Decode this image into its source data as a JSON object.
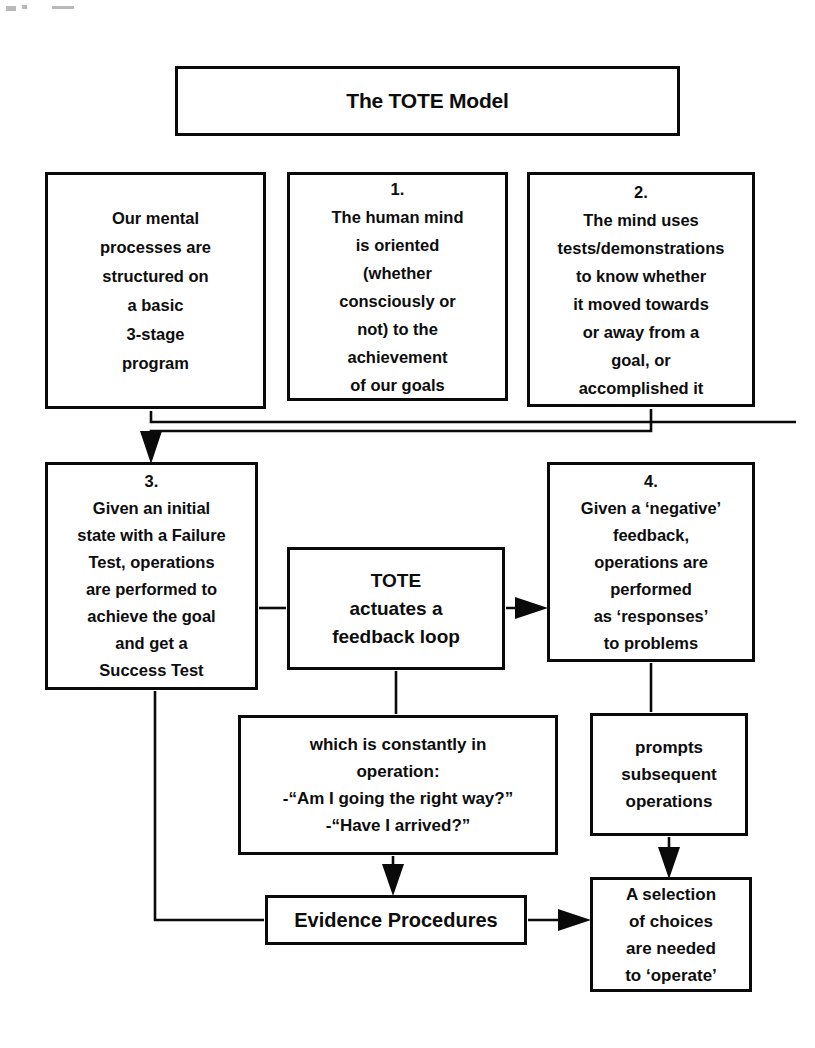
{
  "diagram": {
    "title": "The TOTE Model",
    "boxes": {
      "mental_processes": "Our mental\nprocesses are\nstructured on\na basic\n3-stage\nprogram",
      "step_one": "1.\nThe human mind\nis oriented\n(whether\nconsciously or\nnot) to the\nachievement\nof our goals",
      "step_two": "2.\nThe mind uses\ntests/demonstrations\nto know whether\nit moved towards\nor away from a\ngoal, or\naccomplished it",
      "step_three": "3.\nGiven an initial\nstate with a Failure\nTest, operations\nare performed to\nachieve the goal\nand get a\nSuccess Test",
      "tote_actuates": "TOTE\nactuates a\nfeedback loop",
      "step_four": "4.\nGiven a ‘negative’\nfeedback,\noperations are\nperformed\nas ‘responses’\nto problems",
      "which_constantly": "which is constantly in\noperation:\n-“Am I going the right way?”\n-“Have I arrived?”",
      "prompts_subsequent": "prompts\nsubsequent\noperations",
      "evidence_procedures": "Evidence Procedures",
      "selection_of_choices": "A selection\nof choices\nare needed\nto ‘operate’"
    },
    "colors": {
      "stroke": "#0a0a0a",
      "background": "#ffffff",
      "text": "#0d0d0d"
    },
    "connectors": [
      {
        "name": "step-two-to-step-three",
        "kind": "arrow-elbow",
        "from": "step_two",
        "to": "step_three"
      },
      {
        "name": "mental-processes-to-step-three",
        "kind": "line-elbow",
        "from": "mental_processes",
        "to": "step_three"
      },
      {
        "name": "step-three-to-tote",
        "kind": "line",
        "from": "step_three",
        "to": "tote_actuates"
      },
      {
        "name": "tote-to-step-four",
        "kind": "arrow",
        "from": "tote_actuates",
        "to": "step_four"
      },
      {
        "name": "tote-to-which-constantly",
        "kind": "line",
        "from": "tote_actuates",
        "to": "which_constantly"
      },
      {
        "name": "step-four-to-prompts",
        "kind": "line",
        "from": "step_four",
        "to": "prompts_subsequent"
      },
      {
        "name": "which-constantly-to-evidence",
        "kind": "arrow",
        "from": "which_constantly",
        "to": "evidence_procedures"
      },
      {
        "name": "prompts-to-selection",
        "kind": "arrow",
        "from": "prompts_subsequent",
        "to": "selection_of_choices"
      },
      {
        "name": "step-three-to-evidence",
        "kind": "line-elbow",
        "from": "step_three",
        "to": "evidence_procedures"
      },
      {
        "name": "evidence-to-selection",
        "kind": "arrow",
        "from": "evidence_procedures",
        "to": "selection_of_choices"
      }
    ]
  }
}
